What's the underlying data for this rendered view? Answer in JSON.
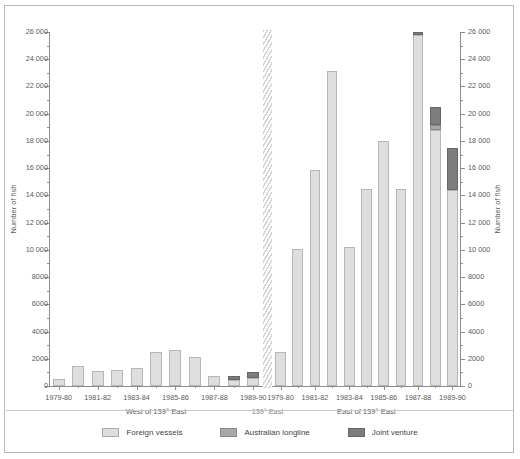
{
  "chart_data": {
    "type": "bar",
    "title": "",
    "subtitle": "",
    "xlabel": "",
    "ylabel": "Number of fish",
    "ylabel_right": "Number of fish",
    "ylim": [
      0,
      26000
    ],
    "ytick_step": 2000,
    "yminor_step": 1000,
    "grid": false,
    "stacked": true,
    "legend_position": "bottom",
    "ytick_labels": [
      "0",
      "2000",
      "4000",
      "6000",
      "8000",
      "10 000",
      "12 000",
      "14 000",
      "16 000",
      "18 000",
      "20 000",
      "22 000",
      "24 000",
      "26 000"
    ],
    "ytick_values": [
      0,
      2000,
      4000,
      6000,
      8000,
      10000,
      12000,
      14000,
      16000,
      18000,
      20000,
      22000,
      24000,
      26000
    ],
    "categories": [
      "1979-80",
      "1980-81",
      "1981-82",
      "1982-83",
      "1983-84",
      "1984-85",
      "1985-86",
      "1986-87",
      "1987-88",
      "1988-89",
      "1989-90"
    ],
    "xtick_labels_shown": [
      "1979-80",
      "1981-82",
      "1983-84",
      "1985-86",
      "1987-88",
      "1989-90"
    ],
    "panels": [
      {
        "name": "west",
        "title": "West of 139° East",
        "series": [
          {
            "name": "Foreign vessels",
            "color": "#dedede",
            "values": [
              550,
              1450,
              1100,
              1200,
              1300,
              2500,
              2650,
              2150,
              700,
              450,
              600
            ]
          },
          {
            "name": "Australian longline",
            "color": "#a8a8a8",
            "values": [
              0,
              0,
              0,
              0,
              0,
              0,
              0,
              0,
              0,
              0,
              0
            ]
          },
          {
            "name": "Joint venture",
            "color": "#7d7d7d",
            "values": [
              0,
              0,
              0,
              0,
              0,
              0,
              0,
              0,
              0,
              300,
              450
            ]
          }
        ]
      },
      {
        "name": "east",
        "title": "East of 139° East",
        "series": [
          {
            "name": "Foreign vessels",
            "color": "#dedede",
            "values": [
              2500,
              10100,
              15850,
              23150,
              10200,
              14500,
              18000,
              14450,
              25750,
              18800,
              14400
            ]
          },
          {
            "name": "Australian longline",
            "color": "#a8a8a8",
            "values": [
              0,
              0,
              0,
              0,
              0,
              0,
              0,
              0,
              0,
              400,
              0
            ]
          },
          {
            "name": "Joint venture",
            "color": "#7d7d7d",
            "values": [
              0,
              0,
              0,
              0,
              0,
              0,
              0,
              0,
              250,
              1300,
              3050
            ]
          }
        ]
      }
    ],
    "divider_label": "139° East",
    "legend": [
      {
        "label": "Foreign vessels",
        "key": "foreign",
        "color": "#dedede"
      },
      {
        "label": "Australian longline",
        "key": "longline",
        "color": "#a8a8a8"
      },
      {
        "label": "Joint venture",
        "key": "joint",
        "color": "#7d7d7d"
      }
    ]
  }
}
